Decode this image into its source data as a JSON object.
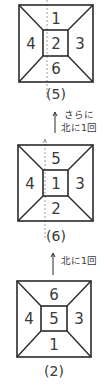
{
  "diagram": {
    "title": "",
    "colors": {
      "line": "#2a2a2a",
      "dash": "#9a9a9a",
      "text": "#3a3a3a"
    },
    "dice": [
      {
        "caption": "(5)",
        "faces": {
          "top": "1",
          "center": "2",
          "left": "4",
          "right": "3",
          "bottom": "6"
        },
        "has_dashed_axis": true
      },
      {
        "caption": "(6)",
        "faces": {
          "top": "5",
          "center": "1",
          "left": "4",
          "right": "3",
          "bottom": "2"
        },
        "has_dashed_axis": true
      },
      {
        "caption": "(2)",
        "faces": {
          "top": "6",
          "center": "5",
          "left": "4",
          "right": "3",
          "bottom": "1"
        },
        "has_dashed_axis": false
      }
    ],
    "arrows": [
      {
        "lines": [
          "さらに",
          "北に1回"
        ]
      },
      {
        "lines": [
          "北に1回"
        ]
      }
    ]
  }
}
